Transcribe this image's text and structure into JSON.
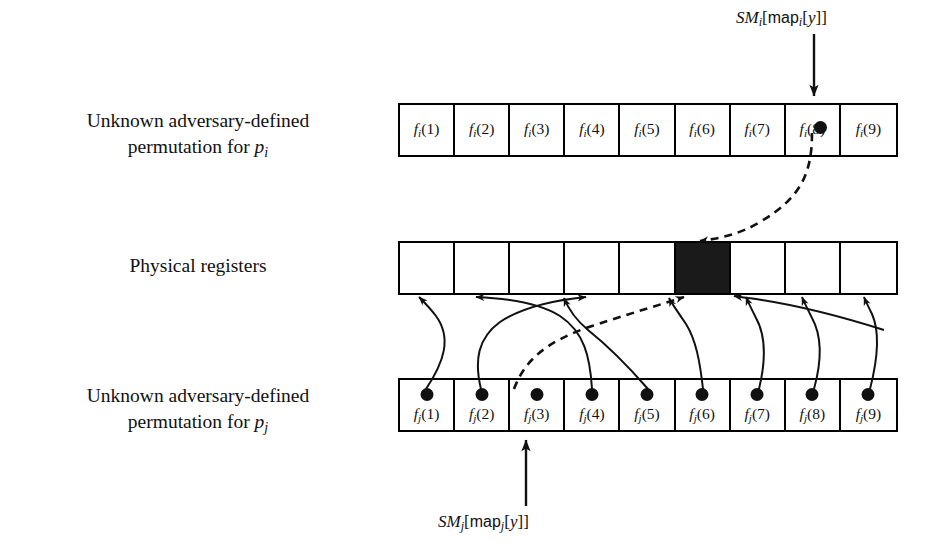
{
  "figure": {
    "accent_color": "#111111",
    "background": "#ffffff",
    "highlight_cell_color": "#1a1a1a"
  },
  "rows": {
    "top": {
      "label_line1": "Unknown adversary-defined",
      "label_line2_prefix": "permutation for ",
      "label_line2_var": "p",
      "label_line2_sub": "i",
      "cells": [
        {
          "fn": "f",
          "sub": "i",
          "arg": "(1)"
        },
        {
          "fn": "f",
          "sub": "i",
          "arg": "(2)"
        },
        {
          "fn": "f",
          "sub": "i",
          "arg": "(3)"
        },
        {
          "fn": "f",
          "sub": "i",
          "arg": "(4)"
        },
        {
          "fn": "f",
          "sub": "i",
          "arg": "(5)"
        },
        {
          "fn": "f",
          "sub": "i",
          "arg": "(6)"
        },
        {
          "fn": "f",
          "sub": "i",
          "arg": "(7)"
        },
        {
          "fn": "f",
          "sub": "i",
          "arg": "(8)"
        },
        {
          "fn": "f",
          "sub": "i",
          "arg": "(9)"
        }
      ],
      "marked_cell_index": 8,
      "marked_cells": [
        8
      ]
    },
    "middle": {
      "label_line1": "Physical registers",
      "cell_count": 9,
      "filled_cell_index": 6,
      "cells": [
        "",
        "",
        "",
        "",
        "",
        "",
        "",
        "",
        ""
      ]
    },
    "bottom": {
      "label_line1": "Unknown adversary-defined",
      "label_line2_prefix": "permutation for ",
      "label_line2_var": "p",
      "label_line2_sub": "j",
      "cells": [
        {
          "fn": "f",
          "sub": "j",
          "arg": "(1)"
        },
        {
          "fn": "f",
          "sub": "j",
          "arg": "(2)"
        },
        {
          "fn": "f",
          "sub": "j",
          "arg": "(3)"
        },
        {
          "fn": "f",
          "sub": "j",
          "arg": "(4)"
        },
        {
          "fn": "f",
          "sub": "j",
          "arg": "(5)"
        },
        {
          "fn": "f",
          "sub": "j",
          "arg": "(6)"
        },
        {
          "fn": "f",
          "sub": "j",
          "arg": "(7)"
        },
        {
          "fn": "f",
          "sub": "j",
          "arg": "(8)"
        },
        {
          "fn": "f",
          "sub": "j",
          "arg": "(9)"
        }
      ],
      "marked_cell_index": 3,
      "all_cells_dotted": true
    }
  },
  "annotations": {
    "top": {
      "prefix_italic": "SM",
      "sub1": "i",
      "bracket_open": "[",
      "sans_word": "map",
      "sub2": "i",
      "inner_open": "[",
      "var": "y",
      "inner_close": "]",
      "bracket_close": "]",
      "full_text": "SM_i[map_i[y]]",
      "points_to": "top-row cell 8",
      "arrow_direction": "down"
    },
    "bottom": {
      "prefix_italic": "SM",
      "sub1": "j",
      "bracket_open": "[",
      "sans_word": "map",
      "sub2": "j",
      "inner_open": "[",
      "var": "y",
      "inner_close": "]",
      "bracket_close": "]",
      "full_text": "SM_j[map_j[y]]",
      "points_to": "bottom-row cell 3",
      "arrow_direction": "up"
    }
  },
  "mapping": {
    "description": "Bottom permutation entries map to physical registers; dashed path links marked cells through the highlighted register.",
    "solid_arrow_count": 8,
    "dashed_arrow_count": 2,
    "bottom_to_register": [
      {
        "from_cell": 1,
        "to_register": 1
      },
      {
        "from_cell": 2,
        "to_register": 3
      },
      {
        "from_cell": 3,
        "to_register": 6
      },
      {
        "from_cell": 4,
        "to_register": 2
      },
      {
        "from_cell": 5,
        "to_register": 4
      },
      {
        "from_cell": 6,
        "to_register": 5
      },
      {
        "from_cell": 7,
        "to_register": 7
      },
      {
        "from_cell": 8,
        "to_register": 8
      },
      {
        "from_cell": 9,
        "to_register": 9
      }
    ],
    "top_to_register": [
      {
        "from_cell": 8,
        "to_register": 6,
        "style": "dashed"
      }
    ]
  }
}
